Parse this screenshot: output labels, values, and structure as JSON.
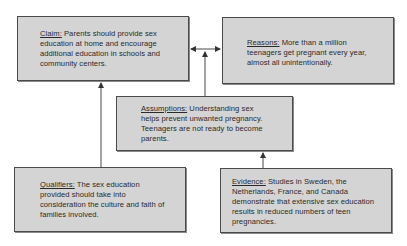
{
  "diagram": {
    "type": "toulmin-argument-model",
    "nodes": [
      {
        "id": "claim",
        "label": "Claim:",
        "text": " Parents should provide sex education at home and encourage additional education in schools and community centers."
      },
      {
        "id": "reasons",
        "label": "Reasons:",
        "text": " More than a million teenagers get pregnant every year, almost all unintentionally."
      },
      {
        "id": "assumptions",
        "label": "Assumptions:",
        "text": " Understanding sex helps prevent unwanted pregnancy. Teenagers are not ready to become parents."
      },
      {
        "id": "qualifiers",
        "label": "Qualifiers:",
        "text": " The sex education provided should take into consideration the culture and faith of families involved."
      },
      {
        "id": "evidence",
        "label": "Evidence:",
        "text": " Studies in Sweden, the Netherlands, France, and Canada demonstrate that extensive sex education results in reduced numbers of teen pregnancies."
      }
    ],
    "edges": [
      {
        "from": "assumptions",
        "to": "claim",
        "style": "arrow"
      },
      {
        "from": "assumptions",
        "to": "reasons",
        "style": "arrow"
      },
      {
        "from": "qualifiers",
        "to": "claim",
        "style": "arrow"
      },
      {
        "from": "evidence",
        "to": "assumptions",
        "style": "arrow"
      }
    ],
    "colors": {
      "box_fill": "#d4d4d4",
      "box_border": "#4a4a4a",
      "line": "#333333",
      "background": "#ffffff"
    }
  }
}
